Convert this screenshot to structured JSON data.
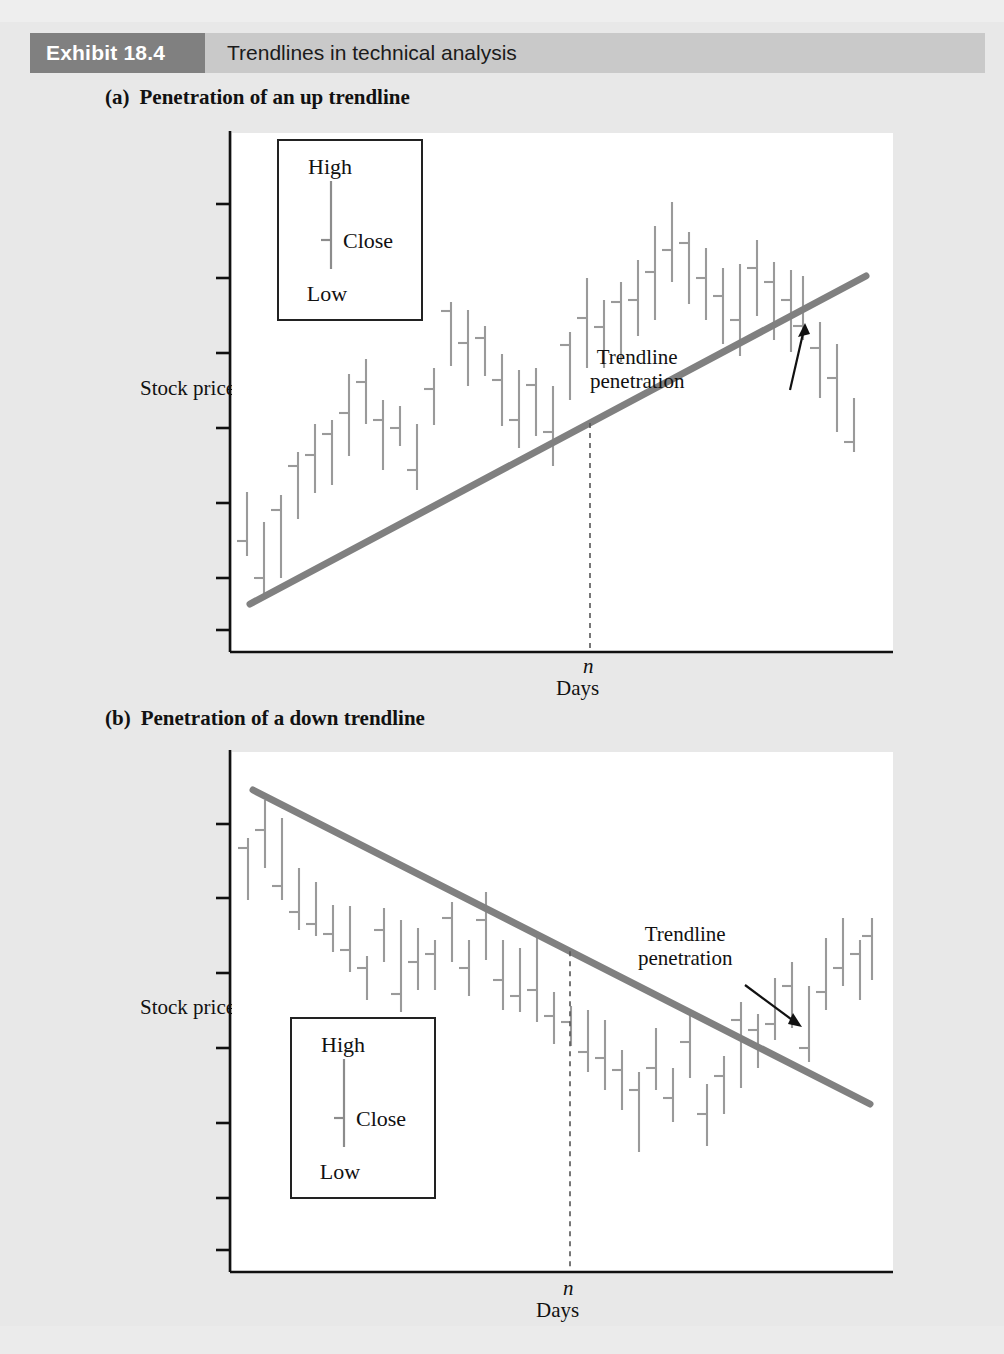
{
  "header": {
    "badge": "Exhibit 18.4",
    "title": "Trendlines in technical analysis",
    "badge_bg": "#808080",
    "bar_bg": "#c9c9c9"
  },
  "panels": [
    {
      "letter": "(a)",
      "subtitle": "Penetration of an up trendline",
      "y_axis_label": "Stock price",
      "x_axis_label": "Days",
      "x_marker_label": "n",
      "annotation_line1": "Trendline",
      "annotation_line2": "penetration",
      "legend": {
        "high": "High",
        "close": "Close",
        "low": "Low"
      }
    },
    {
      "letter": "(b)",
      "subtitle": "Penetration of a down trendline",
      "y_axis_label": "Stock price",
      "x_axis_label": "Days",
      "x_marker_label": "n",
      "annotation_line1": "Trendline",
      "annotation_line2": "penetration",
      "legend": {
        "high": "High",
        "close": "Close",
        "low": "Low"
      }
    }
  ],
  "chart_data": [
    {
      "type": "ohlc-bar",
      "title": "(a) Penetration of an up trendline",
      "xlabel": "Days",
      "ylabel": "Stock price",
      "grid": false,
      "legend": [
        "High",
        "Close",
        "Low"
      ],
      "trend": "up",
      "trendline": {
        "x1": 250,
        "y1": 604,
        "x2": 866,
        "y2": 276,
        "color": "#808080",
        "width": 7
      },
      "marker_x": 590,
      "marker_label": "n",
      "annotation": {
        "text": "Trendline penetration",
        "arrow_from": [
          800,
          360
        ],
        "arrow_to": [
          802,
          325
        ]
      },
      "bars": [
        {
          "x": 247,
          "high": 492,
          "low": 556,
          "close": 541
        },
        {
          "x": 264,
          "high": 522,
          "low": 594,
          "close": 578
        },
        {
          "x": 281,
          "high": 495,
          "low": 578,
          "close": 510
        },
        {
          "x": 298,
          "high": 452,
          "low": 519,
          "close": 466
        },
        {
          "x": 315,
          "high": 424,
          "low": 493,
          "close": 455
        },
        {
          "x": 332,
          "high": 420,
          "low": 485,
          "close": 434
        },
        {
          "x": 349,
          "high": 374,
          "low": 456,
          "close": 413
        },
        {
          "x": 366,
          "high": 359,
          "low": 424,
          "close": 382
        },
        {
          "x": 383,
          "high": 400,
          "low": 470,
          "close": 420
        },
        {
          "x": 400,
          "high": 406,
          "low": 446,
          "close": 428
        },
        {
          "x": 417,
          "high": 424,
          "low": 490,
          "close": 470
        },
        {
          "x": 434,
          "high": 368,
          "low": 425,
          "close": 389
        },
        {
          "x": 451,
          "high": 302,
          "low": 366,
          "close": 311
        },
        {
          "x": 468,
          "high": 310,
          "low": 386,
          "close": 343
        },
        {
          "x": 485,
          "high": 326,
          "low": 376,
          "close": 338
        },
        {
          "x": 502,
          "high": 354,
          "low": 426,
          "close": 380
        },
        {
          "x": 519,
          "high": 370,
          "low": 448,
          "close": 420
        },
        {
          "x": 536,
          "high": 368,
          "low": 436,
          "close": 385
        },
        {
          "x": 553,
          "high": 386,
          "low": 466,
          "close": 432
        },
        {
          "x": 570,
          "high": 332,
          "low": 400,
          "close": 345
        },
        {
          "x": 587,
          "high": 278,
          "low": 368,
          "close": 318
        },
        {
          "x": 604,
          "high": 300,
          "low": 368,
          "close": 327
        },
        {
          "x": 621,
          "high": 282,
          "low": 362,
          "close": 302
        },
        {
          "x": 638,
          "high": 260,
          "low": 336,
          "close": 300
        },
        {
          "x": 655,
          "high": 226,
          "low": 320,
          "close": 272
        },
        {
          "x": 672,
          "high": 202,
          "low": 282,
          "close": 250
        },
        {
          "x": 689,
          "high": 232,
          "low": 304,
          "close": 243
        },
        {
          "x": 706,
          "high": 248,
          "low": 320,
          "close": 278
        },
        {
          "x": 723,
          "high": 268,
          "low": 344,
          "close": 296
        },
        {
          "x": 740,
          "high": 264,
          "low": 356,
          "close": 320
        },
        {
          "x": 757,
          "high": 240,
          "low": 316,
          "close": 268
        },
        {
          "x": 774,
          "high": 262,
          "low": 340,
          "close": 282
        },
        {
          "x": 791,
          "high": 270,
          "low": 352,
          "close": 300
        },
        {
          "x": 803,
          "high": 276,
          "low": 340,
          "close": 326
        },
        {
          "x": 820,
          "high": 322,
          "low": 398,
          "close": 348
        },
        {
          "x": 837,
          "high": 344,
          "low": 432,
          "close": 378
        },
        {
          "x": 854,
          "high": 398,
          "low": 452,
          "close": 442
        }
      ]
    },
    {
      "type": "ohlc-bar",
      "title": "(b) Penetration of a down trendline",
      "xlabel": "Days",
      "ylabel": "Stock price",
      "grid": false,
      "legend": [
        "High",
        "Close",
        "Low"
      ],
      "trend": "down",
      "trendline": {
        "x1": 253,
        "y1": 790,
        "x2": 870,
        "y2": 1104,
        "color": "#808080",
        "width": 7
      },
      "marker_x": 570,
      "marker_label": "n",
      "annotation": {
        "text": "Trendline penetration",
        "arrow_from": [
          745,
          985
        ],
        "arrow_to": [
          800,
          1026
        ]
      },
      "bars": [
        {
          "x": 248,
          "high": 838,
          "low": 900,
          "close": 848
        },
        {
          "x": 265,
          "high": 800,
          "low": 868,
          "close": 830
        },
        {
          "x": 282,
          "high": 818,
          "low": 900,
          "close": 886
        },
        {
          "x": 299,
          "high": 868,
          "low": 930,
          "close": 912
        },
        {
          "x": 316,
          "high": 882,
          "low": 936,
          "close": 924
        },
        {
          "x": 333,
          "high": 905,
          "low": 952,
          "close": 934
        },
        {
          "x": 350,
          "high": 906,
          "low": 972,
          "close": 950
        },
        {
          "x": 367,
          "high": 956,
          "low": 1000,
          "close": 968
        },
        {
          "x": 384,
          "high": 908,
          "low": 962,
          "close": 930
        },
        {
          "x": 401,
          "high": 920,
          "low": 1012,
          "close": 994
        },
        {
          "x": 418,
          "high": 928,
          "low": 990,
          "close": 962
        },
        {
          "x": 435,
          "high": 940,
          "low": 990,
          "close": 954
        },
        {
          "x": 452,
          "high": 902,
          "low": 962,
          "close": 918
        },
        {
          "x": 469,
          "high": 940,
          "low": 996,
          "close": 968
        },
        {
          "x": 486,
          "high": 892,
          "low": 960,
          "close": 920
        },
        {
          "x": 503,
          "high": 940,
          "low": 1010,
          "close": 980
        },
        {
          "x": 520,
          "high": 948,
          "low": 1012,
          "close": 996
        },
        {
          "x": 537,
          "high": 938,
          "low": 1022,
          "close": 990
        },
        {
          "x": 554,
          "high": 992,
          "low": 1044,
          "close": 1016
        },
        {
          "x": 571,
          "high": 1006,
          "low": 1046,
          "close": 1022
        },
        {
          "x": 588,
          "high": 1010,
          "low": 1072,
          "close": 1052
        },
        {
          "x": 605,
          "high": 1020,
          "low": 1090,
          "close": 1058
        },
        {
          "x": 622,
          "high": 1050,
          "low": 1110,
          "close": 1070
        },
        {
          "x": 639,
          "high": 1072,
          "low": 1152,
          "close": 1090
        },
        {
          "x": 656,
          "high": 1028,
          "low": 1090,
          "close": 1068
        },
        {
          "x": 673,
          "high": 1068,
          "low": 1122,
          "close": 1098
        },
        {
          "x": 690,
          "high": 1012,
          "low": 1078,
          "close": 1042
        },
        {
          "x": 707,
          "high": 1084,
          "low": 1146,
          "close": 1114
        },
        {
          "x": 724,
          "high": 1056,
          "low": 1114,
          "close": 1076
        },
        {
          "x": 741,
          "high": 1002,
          "low": 1088,
          "close": 1020
        },
        {
          "x": 758,
          "high": 1014,
          "low": 1068,
          "close": 1030
        },
        {
          "x": 775,
          "high": 978,
          "low": 1040,
          "close": 1024
        },
        {
          "x": 792,
          "high": 962,
          "low": 1028,
          "close": 986
        },
        {
          "x": 809,
          "high": 986,
          "low": 1062,
          "close": 1048
        },
        {
          "x": 826,
          "high": 938,
          "low": 1010,
          "close": 992
        },
        {
          "x": 843,
          "high": 918,
          "low": 986,
          "close": 968
        },
        {
          "x": 860,
          "high": 940,
          "low": 1000,
          "close": 954
        },
        {
          "x": 872,
          "high": 918,
          "low": 980,
          "close": 936
        }
      ]
    }
  ]
}
